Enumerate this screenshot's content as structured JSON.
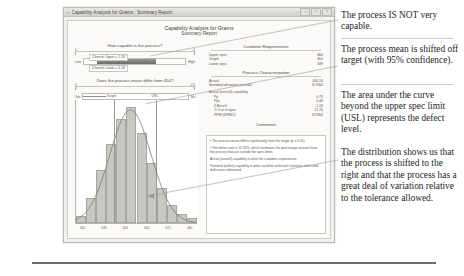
{
  "window": {
    "title": "Capability Analysis for Grams : Summary Report",
    "minimize_label": "–",
    "maximize_label": "□",
    "close_label": "✕",
    "menu_icon": "window-menu-icon"
  },
  "report": {
    "title": "Capability Analysis for Grams",
    "subtitle": "Summary Report"
  },
  "capability_gauge": {
    "question": "How capable is the process?",
    "low_label": "Low",
    "high_label": "High",
    "upper_box": "Z.bench Upper = 1.18",
    "lower_box": "Z.bench Lower = 1.18",
    "scale_tick_left": "0",
    "scale_tick_right": "6"
  },
  "mean_gauge": {
    "question": "Does the process mean differ from 454?",
    "yes_label": "Yes",
    "no_label": "No",
    "p_value": "P = 0.001",
    "tick_left": "0",
    "tick_right": "0.5",
    "threshold_label": "0.05"
  },
  "histogram": {
    "title": "Actual (Overall) Capability",
    "subtitle": "Are the data inside the limits and close to the target?",
    "target_label": "Target",
    "usl_label": "USL",
    "x_ticks": [
      "440",
      "448",
      "456",
      "464",
      "472",
      "480"
    ],
    "bin_heights": [
      6,
      22,
      46,
      68,
      90,
      100,
      78,
      52,
      30,
      16,
      8,
      4
    ],
    "target_position_pct": 31,
    "usl_position_pct": 66
  },
  "customer_requirements": {
    "heading": "Customer Requirements",
    "rows": [
      {
        "label": "Upper spec",
        "value": "464"
      },
      {
        "label": "Target",
        "value": "454"
      },
      {
        "label": "Lower spec",
        "value": "439"
      }
    ]
  },
  "process_characterization": {
    "heading": "Process Characterization",
    "rows": [
      {
        "label": "Actual",
        "value": "460.24"
      },
      {
        "label": "Standard deviation (overall)",
        "value": "8.2564"
      }
    ],
    "capability_heading": "Actual (overall) capability",
    "capability_rows": [
      {
        "label": "Pp",
        "value": "0.73"
      },
      {
        "label": "Ppk",
        "value": "0.40"
      },
      {
        "label": "Z.Bench",
        "value": "1.18"
      },
      {
        "label": "% Out of spec",
        "value": "11.76"
      },
      {
        "label": "PPM (DPMO)",
        "value": "117564"
      }
    ]
  },
  "comments": {
    "heading": "Comments",
    "items": [
      "• The process mean differs significantly from the target (p < 0.05).",
      "• The defect rate is 11.76%, which estimates the percentage of parts from the process that are outside the spec limits.",
      "Actual (overall) capability is what the customer experiences.",
      "Potential (within) capability is what could be achieved if process shifts and drifts were eliminated."
    ]
  },
  "annotations": [
    {
      "id": "callout-1",
      "text": "The process IS NOT very capable."
    },
    {
      "id": "callout-2",
      "text": "The process mean is shifted off target (with 95% confidence)."
    },
    {
      "id": "callout-3",
      "text": "The area under the curve beyond the upper spec limit (USL) represents the defect level."
    },
    {
      "id": "callout-4",
      "text": "The distribution shows us that the process is shifted to the right and that the process has a great deal of variation relative to the tolerance allowed."
    }
  ],
  "colors": {
    "window_chrome": "#f2f1ef",
    "bar_fill": "#c9c7c2",
    "text": "#231f1c",
    "rule": "#6f6d68"
  }
}
